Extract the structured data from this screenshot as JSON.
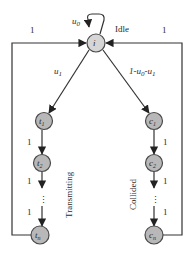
{
  "diagram": {
    "type": "state-transition",
    "nodes": {
      "idle": {
        "label": "i",
        "state_name": "Idle"
      },
      "t1": {
        "label": "t",
        "sub": "1"
      },
      "t2": {
        "label": "t",
        "sub": "2"
      },
      "tn": {
        "label": "t",
        "sub": "n"
      },
      "c1": {
        "label": "c",
        "sub": "1"
      },
      "c2": {
        "label": "c",
        "sub": "2"
      },
      "cn": {
        "label": "c",
        "sub": "n"
      }
    },
    "edges": {
      "self_loop": {
        "label": "u",
        "sub": "0"
      },
      "to_transmitting": {
        "label": "u",
        "sub": "1"
      },
      "to_collided": {
        "label": "1-u",
        "sub1": "0",
        "mid": "-u",
        "sub2": "1"
      },
      "left_return": "1",
      "right_return": "1",
      "t1_t2": "1",
      "t2_dots": "1",
      "dots_tn": "1",
      "c1_c2": "1",
      "c2_dots": "1",
      "dots_cn": "1"
    },
    "branch_labels": {
      "transmitting": "Transmitting",
      "collided": "Collided"
    },
    "ellipsis": "⋮"
  }
}
